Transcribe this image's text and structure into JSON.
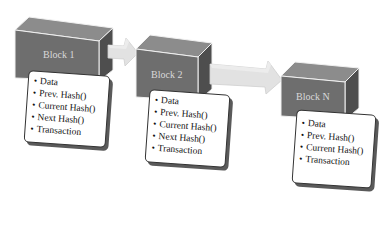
{
  "diagram": {
    "type": "blockchain-chain",
    "colors": {
      "cube_front": "#6e6e6e",
      "cube_top": "#8c8c8c",
      "cube_side": "#4e4e4e",
      "cube_edge": "#f0f0f0",
      "arrow_fill": "#e2e2e2",
      "card_border": "#333333",
      "card_shadow": "#5a5a5a"
    },
    "blocks": [
      {
        "label": "Block 1",
        "fields": [
          "Data",
          "Prev. Hash()",
          "Current Hash()",
          "Next Hash()",
          "Transaction"
        ]
      },
      {
        "label": "Block 2",
        "fields": [
          "Data",
          "Prev. Hash()",
          "Current Hash()",
          "Next Hash()",
          "Transaction"
        ]
      },
      {
        "label": "Block N",
        "fields": [
          "Data",
          "Prev. Hash()",
          "Current Hash()",
          "Transaction"
        ]
      }
    ],
    "connectors": [
      {
        "from": "Block 1",
        "to": "Block 2"
      },
      {
        "from": "Block 2",
        "to": "Block N"
      }
    ],
    "bullet_glyph": "•"
  }
}
